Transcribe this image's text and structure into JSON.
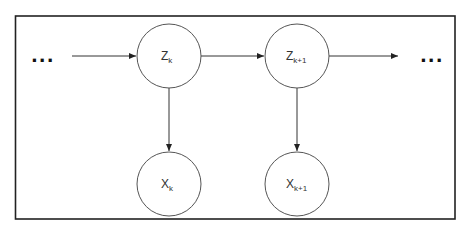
{
  "diagram": {
    "type": "hidden-markov-model",
    "frame": {
      "x": 15,
      "y": 16,
      "width": 440,
      "height": 203,
      "stroke": "#222222"
    },
    "ellipsis_left": "...",
    "ellipsis_right": "...",
    "nodes": [
      {
        "id": "z_k",
        "label": "Z",
        "subscript": "k",
        "cx": 169,
        "cy": 56,
        "r": 32,
        "kind": "hidden-state"
      },
      {
        "id": "z_k1",
        "label": "Z",
        "subscript": "k+1",
        "cx": 297,
        "cy": 56,
        "r": 32,
        "kind": "hidden-state"
      },
      {
        "id": "x_k",
        "label": "X",
        "subscript": "k",
        "cx": 169,
        "cy": 184,
        "r": 32,
        "kind": "observation"
      },
      {
        "id": "x_k1",
        "label": "X",
        "subscript": "k+1",
        "cx": 297,
        "cy": 184,
        "r": 32,
        "kind": "observation"
      }
    ],
    "edges": [
      {
        "from": "ellipsis_left",
        "to": "z_k"
      },
      {
        "from": "z_k",
        "to": "z_k1"
      },
      {
        "from": "z_k1",
        "to": "ellipsis_right"
      },
      {
        "from": "z_k",
        "to": "x_k"
      },
      {
        "from": "z_k1",
        "to": "x_k1"
      }
    ],
    "colors": {
      "stroke": "#333333",
      "fill": "#ffffff",
      "text": "#333333"
    }
  }
}
